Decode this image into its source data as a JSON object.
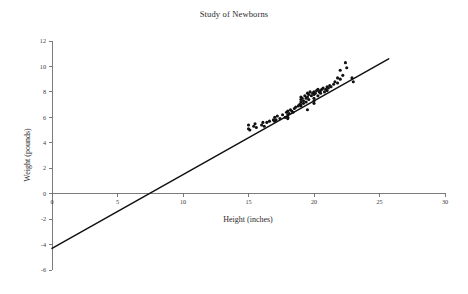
{
  "chart_data": {
    "type": "scatter",
    "title": "Study of Newborns",
    "xlabel": "Height (inches)",
    "ylabel": "Weight (pounds)",
    "xlim": [
      0,
      30
    ],
    "ylim": [
      -6,
      12
    ],
    "xticks": [
      0,
      5,
      10,
      15,
      20,
      25,
      30
    ],
    "yticks": [
      -6,
      -4,
      -2,
      0,
      2,
      4,
      6,
      8,
      10,
      12
    ],
    "xtick_labels": [
      "0",
      "5",
      "10",
      "15",
      "20",
      "25",
      "30"
    ],
    "ytick_labels": [
      "-6",
      "-4",
      "-2",
      "0",
      "2",
      "4",
      "6",
      "8",
      "10",
      "12"
    ],
    "grid": false,
    "legend": "none",
    "marker_color": "#111111",
    "line_color": "#111111",
    "series": [
      {
        "name": "Newborn measurements",
        "type": "scatter",
        "points": [
          [
            15.0,
            5.1
          ],
          [
            15.0,
            5.4
          ],
          [
            15.1,
            5.0
          ],
          [
            15.4,
            5.3
          ],
          [
            15.5,
            5.5
          ],
          [
            15.6,
            5.2
          ],
          [
            16.0,
            5.4
          ],
          [
            16.1,
            5.6
          ],
          [
            16.2,
            5.3
          ],
          [
            16.4,
            5.6
          ],
          [
            16.6,
            5.7
          ],
          [
            16.9,
            5.8
          ],
          [
            17.0,
            6.0
          ],
          [
            17.0,
            5.7
          ],
          [
            17.1,
            5.8
          ],
          [
            17.2,
            6.1
          ],
          [
            17.4,
            5.9
          ],
          [
            17.6,
            6.2
          ],
          [
            17.8,
            6.0
          ],
          [
            17.9,
            6.4
          ],
          [
            18.0,
            6.5
          ],
          [
            18.0,
            6.2
          ],
          [
            18.0,
            5.9
          ],
          [
            18.0,
            6.0
          ],
          [
            18.1,
            6.3
          ],
          [
            18.2,
            6.6
          ],
          [
            18.3,
            6.5
          ],
          [
            18.4,
            6.4
          ],
          [
            18.5,
            6.7
          ],
          [
            18.6,
            6.8
          ],
          [
            18.8,
            6.9
          ],
          [
            18.9,
            7.0
          ],
          [
            19.0,
            7.6
          ],
          [
            19.0,
            7.4
          ],
          [
            19.0,
            7.2
          ],
          [
            19.0,
            7.0
          ],
          [
            19.0,
            6.9
          ],
          [
            19.1,
            7.5
          ],
          [
            19.2,
            7.3
          ],
          [
            19.2,
            7.1
          ],
          [
            19.3,
            7.7
          ],
          [
            19.4,
            7.5
          ],
          [
            19.4,
            7.2
          ],
          [
            19.5,
            7.9
          ],
          [
            19.5,
            7.6
          ],
          [
            19.5,
            6.6
          ],
          [
            19.6,
            7.8
          ],
          [
            19.6,
            7.4
          ],
          [
            19.7,
            8.0
          ],
          [
            19.8,
            7.7
          ],
          [
            19.9,
            7.9
          ],
          [
            20.0,
            8.0
          ],
          [
            20.0,
            7.8
          ],
          [
            20.0,
            7.5
          ],
          [
            20.0,
            7.3
          ],
          [
            20.0,
            7.1
          ],
          [
            20.1,
            7.9
          ],
          [
            20.2,
            8.1
          ],
          [
            20.3,
            7.7
          ],
          [
            20.3,
            8.2
          ],
          [
            20.4,
            8.0
          ],
          [
            20.5,
            8.1
          ],
          [
            20.5,
            7.9
          ],
          [
            20.6,
            8.2
          ],
          [
            20.7,
            8.3
          ],
          [
            20.8,
            8.0
          ],
          [
            20.9,
            8.2
          ],
          [
            21.0,
            8.4
          ],
          [
            21.0,
            8.1
          ],
          [
            21.1,
            8.3
          ],
          [
            21.2,
            8.5
          ],
          [
            21.3,
            8.4
          ],
          [
            21.5,
            8.6
          ],
          [
            21.6,
            8.8
          ],
          [
            21.8,
            9.1
          ],
          [
            21.8,
            8.7
          ],
          [
            22.0,
            9.7
          ],
          [
            22.0,
            9.0
          ],
          [
            22.2,
            9.3
          ],
          [
            22.4,
            10.3
          ],
          [
            22.5,
            9.9
          ],
          [
            22.9,
            9.1
          ],
          [
            23.0,
            8.8
          ]
        ]
      },
      {
        "name": "Least-squares regression line",
        "type": "line",
        "slope": 0.58,
        "intercept": -4.3,
        "endpoints": [
          [
            0,
            -4.3
          ],
          [
            25.7,
            10.6
          ]
        ]
      }
    ]
  }
}
